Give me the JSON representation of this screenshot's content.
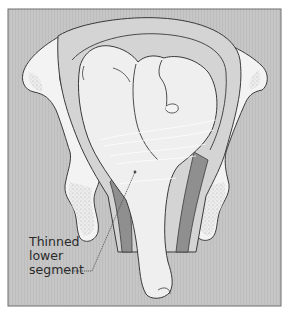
{
  "diagram": {
    "labels": [
      {
        "id": "thinned-lower-segment",
        "lines": [
          "Thinned",
          "lower",
          "segment"
        ]
      }
    ],
    "colors": {
      "background_panel": "#c4c4c4",
      "frame_border": "#7a7a7a",
      "bone_fill": "#f2f2f2",
      "bone_stipple": "#a8a8a8",
      "uterus_wall": "#d6d6d6",
      "fetus_fill": "#eeeeee",
      "thick_muscle": "#8e8e8e",
      "outline": "#3a3a3a"
    }
  }
}
